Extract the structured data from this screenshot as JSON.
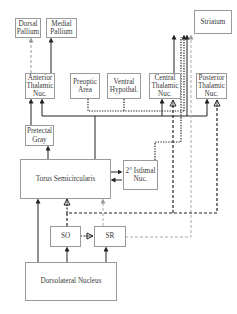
{
  "diagram": {
    "type": "neural-connectivity-diagram",
    "nodes": [
      {
        "id": "dorsal_pallium",
        "label": "Dorsal\nPallium"
      },
      {
        "id": "medial_pallium",
        "label": "Medial\nPallium"
      },
      {
        "id": "striatum",
        "label": "Striatum"
      },
      {
        "id": "anterior_thalamic",
        "label": "Anterior\nThalamic\nNuc."
      },
      {
        "id": "preoptic_area",
        "label": "Preoptic\nArea"
      },
      {
        "id": "ventral_hypothal",
        "label": "Ventral\nHypothal."
      },
      {
        "id": "central_thalamic",
        "label": "Central\nThalamic\nNuc."
      },
      {
        "id": "posterior_thalamic",
        "label": "Posterior\nThalamic\nNuc."
      },
      {
        "id": "pretectal_gray",
        "label": "Pretectal\nGray"
      },
      {
        "id": "torus_semicircularis",
        "label": "Torus Semicircularis"
      },
      {
        "id": "isthmal_nuc",
        "label": "2° Isthmal\nNuc."
      },
      {
        "id": "so",
        "label": "SO"
      },
      {
        "id": "sr",
        "label": "SR"
      },
      {
        "id": "dorsolateral_nucleus",
        "label": "Dorsolateral Nucleus"
      }
    ],
    "edges": [
      {
        "from": "anterior_thalamic",
        "to": "dorsal_pallium",
        "style": "dashed-gray"
      },
      {
        "from": "anterior_thalamic",
        "to": "medial_pallium",
        "style": "solid"
      },
      {
        "from": "pretectal_gray",
        "to": "anterior_thalamic",
        "style": "solid"
      },
      {
        "from": "torus_semicircularis",
        "to": "anterior_thalamic",
        "style": "solid"
      },
      {
        "from": "torus_semicircularis",
        "to": "pretectal_gray",
        "style": "solid"
      },
      {
        "from": "torus_semicircularis",
        "to": "central_thalamic",
        "style": "solid"
      },
      {
        "from": "torus_semicircularis",
        "to": "posterior_thalamic",
        "style": "solid"
      },
      {
        "from": "torus_semicircularis",
        "to": "isthmal_nuc",
        "style": "solid"
      },
      {
        "from": "isthmal_nuc",
        "to": "torus_semicircularis",
        "style": "solid"
      },
      {
        "from": "preoptic_area",
        "to": "striatum",
        "style": "dotted"
      },
      {
        "from": "ventral_hypothal",
        "to": "striatum",
        "style": "dotted"
      },
      {
        "from": "isthmal_nuc",
        "to": "striatum",
        "style": "dotted"
      },
      {
        "from": "central_thalamic",
        "to": "striatum",
        "style": "solid"
      },
      {
        "from": "torus_semicircularis",
        "to": "striatum",
        "style": "solid"
      },
      {
        "from": "sr",
        "to": "striatum",
        "style": "dashed-gray"
      },
      {
        "from": "so",
        "to": "central_thalamic",
        "style": "dashed-inhibitory"
      },
      {
        "from": "so",
        "to": "posterior_thalamic",
        "style": "dashed-inhibitory"
      },
      {
        "from": "so",
        "to": "torus_semicircularis",
        "style": "dashed-inhibitory"
      },
      {
        "from": "so",
        "to": "sr",
        "style": "dashed-inhibitory"
      },
      {
        "from": "sr",
        "to": "torus_semicircularis",
        "style": "dashed-gray"
      },
      {
        "from": "dorsolateral_nucleus",
        "to": "so",
        "style": "solid"
      },
      {
        "from": "dorsolateral_nucleus",
        "to": "sr",
        "style": "solid"
      },
      {
        "from": "dorsolateral_nucleus",
        "to": "torus_semicircularis",
        "style": "solid"
      }
    ],
    "legend_styles": {
      "solid": "#222222",
      "dashed-gray": "#aaaaaa",
      "dotted": "#222222",
      "dashed-inhibitory": "#222222"
    }
  }
}
